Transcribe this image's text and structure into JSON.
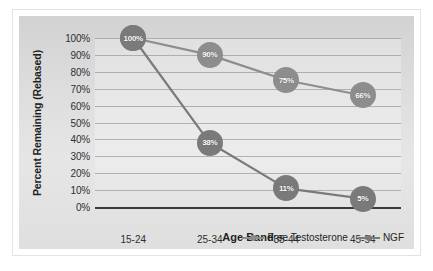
{
  "chart_data": {
    "type": "line",
    "title": "",
    "xlabel": "Age Band",
    "ylabel": "Percent Remaining (Rebased)",
    "categories": [
      "15-24",
      "25-34",
      "35-44",
      "45-54"
    ],
    "ylim": [
      0,
      100
    ],
    "ytick_labels": [
      "100%",
      "90%",
      "80%",
      "70%",
      "60%",
      "50%",
      "40%",
      "30%",
      "20%",
      "10%",
      "0%"
    ],
    "ytick_values": [
      100,
      90,
      80,
      70,
      60,
      50,
      40,
      30,
      20,
      10,
      0
    ],
    "grid": true,
    "legend_position": "bottom-right",
    "series": [
      {
        "name": "Free Testosterone",
        "color": "#8d8d8d",
        "values": [
          100,
          90,
          75,
          66
        ],
        "point_labels": [
          "100%",
          "90%",
          "75%",
          "66%"
        ]
      },
      {
        "name": "NGF",
        "color": "#7a7a7a",
        "values": [
          100,
          38,
          11,
          5
        ],
        "point_labels": [
          "100%",
          "38%",
          "11%",
          "5%"
        ]
      }
    ]
  },
  "colors": {
    "plot_background": "#e8e8e8",
    "card_background": "#dcdcdc",
    "gridline": "#9d9d9d",
    "axis": "#3b3b3b",
    "marker_text": "#ffffff",
    "series_free_testosterone": "#8d8d8d",
    "series_ngf": "#7a7a7a"
  }
}
